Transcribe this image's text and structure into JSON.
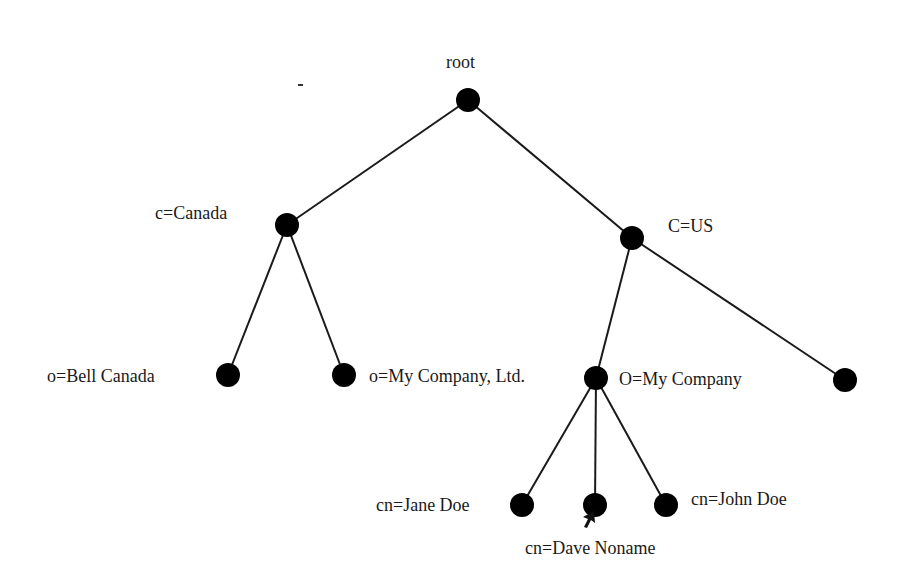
{
  "diagram": {
    "type": "ldap-directory-tree",
    "colors": {
      "node": "#000000",
      "edge": "#1a1a1a",
      "text": "#1a1a1a",
      "background": "#ffffff"
    },
    "nodes": [
      {
        "id": "root",
        "label": "root",
        "x": 468,
        "y": 100,
        "label_x": 446,
        "label_y": 52
      },
      {
        "id": "c-canada",
        "label": "c=Canada",
        "x": 287,
        "y": 225,
        "label_x": 155,
        "label_y": 203
      },
      {
        "id": "c-us",
        "label": "C=US",
        "x": 632,
        "y": 238,
        "label_x": 668,
        "label_y": 216
      },
      {
        "id": "o-bell-canada",
        "label": "o=Bell Canada",
        "x": 228,
        "y": 375,
        "label_x": 47,
        "label_y": 366
      },
      {
        "id": "o-my-company-ltd",
        "label": "o=My Company, Ltd.",
        "x": 344,
        "y": 375,
        "label_x": 369,
        "label_y": 366
      },
      {
        "id": "o-my-company",
        "label": "O=My Company",
        "x": 596,
        "y": 378,
        "label_x": 619,
        "label_y": 369
      },
      {
        "id": "us-other",
        "label": "",
        "x": 845,
        "y": 380,
        "label_x": 0,
        "label_y": 0
      },
      {
        "id": "cn-jane-doe",
        "label": "cn=Jane Doe",
        "x": 522,
        "y": 505,
        "label_x": 376,
        "label_y": 495
      },
      {
        "id": "cn-dave-noname",
        "label": "cn=Dave Noname",
        "x": 595,
        "y": 505,
        "label_x": 525,
        "label_y": 538
      },
      {
        "id": "cn-john-doe",
        "label": "cn=John Doe",
        "x": 666,
        "y": 505,
        "label_x": 691,
        "label_y": 489
      }
    ],
    "edges": [
      {
        "from": "root",
        "to": "c-canada"
      },
      {
        "from": "root",
        "to": "c-us"
      },
      {
        "from": "c-canada",
        "to": "o-bell-canada"
      },
      {
        "from": "c-canada",
        "to": "o-my-company-ltd"
      },
      {
        "from": "c-us",
        "to": "o-my-company"
      },
      {
        "from": "c-us",
        "to": "us-other"
      },
      {
        "from": "o-my-company",
        "to": "cn-jane-doe"
      },
      {
        "from": "o-my-company",
        "to": "cn-dave-noname"
      },
      {
        "from": "o-my-company",
        "to": "cn-john-doe"
      }
    ],
    "node_radius": 12,
    "cursor": {
      "icon": "mouse-pointer-icon",
      "x": 594,
      "y": 511
    }
  }
}
